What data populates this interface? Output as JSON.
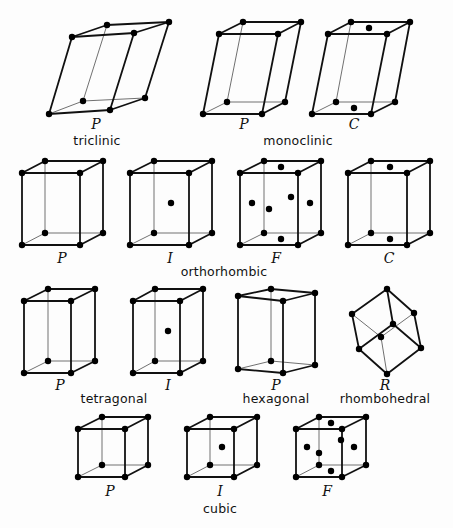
{
  "colors": {
    "line": "#111111",
    "node": "#000000",
    "background": "#fdfdfd"
  },
  "systems": [
    {
      "name": "triclinic",
      "label_pos": [
        97,
        145
      ]
    },
    {
      "name": "monoclinic",
      "label_pos": [
        298,
        145
      ]
    },
    {
      "name": "orthorhombic",
      "label_pos": [
        224,
        276
      ]
    },
    {
      "name": "tetragonal",
      "label_pos": [
        114,
        403
      ]
    },
    {
      "name": "hexagonal",
      "label_pos": [
        276,
        403
      ]
    },
    {
      "name": "rhombohedral",
      "label_pos": [
        385,
        403
      ]
    },
    {
      "name": "cubic",
      "label_pos": [
        220,
        513
      ]
    }
  ],
  "lattices": [
    {
      "id": "triclinic-P",
      "system": "triclinic",
      "centering": "P",
      "letter_pos": [
        96,
        129
      ],
      "vertices": {
        "tbl": [
          107,
          25
        ],
        "tbr": [
          169,
          22
        ],
        "tfl": [
          72,
          37
        ],
        "tfr": [
          134,
          33
        ],
        "bbl": [
          83,
          101
        ],
        "bbr": [
          145,
          98
        ],
        "bfl": [
          49,
          114
        ],
        "bfr": [
          110,
          110
        ]
      },
      "extra_points": []
    },
    {
      "id": "monoclinic-P",
      "system": "monoclinic",
      "centering": "P",
      "letter_pos": [
        244,
        129
      ],
      "vertices": {
        "tbl": [
          243,
          22
        ],
        "tbr": [
          301,
          22
        ],
        "tfl": [
          219,
          34
        ],
        "tfr": [
          278,
          34
        ],
        "bbl": [
          227,
          102
        ],
        "bbr": [
          285,
          102
        ],
        "bfl": [
          203,
          114
        ],
        "bfr": [
          262,
          114
        ]
      },
      "extra_points": []
    },
    {
      "id": "monoclinic-C",
      "system": "monoclinic",
      "centering": "C",
      "letter_pos": [
        354,
        129
      ],
      "vertices": {
        "tbl": [
          351,
          22
        ],
        "tbr": [
          410,
          22
        ],
        "tfl": [
          328,
          34
        ],
        "tfr": [
          387,
          34
        ],
        "bbl": [
          336,
          102
        ],
        "bbr": [
          395,
          102
        ],
        "bfl": [
          312,
          114
        ],
        "bfr": [
          371,
          114
        ]
      },
      "extra_points": [
        [
          369,
          28
        ],
        [
          354,
          108
        ]
      ]
    },
    {
      "id": "orthorhombic-P",
      "system": "orthorhombic",
      "centering": "P",
      "letter_pos": [
        62,
        263
      ],
      "vertices": {
        "tbl": [
          45,
          161
        ],
        "tbr": [
          103,
          161
        ],
        "tfl": [
          22,
          173
        ],
        "tfr": [
          80,
          173
        ],
        "bbl": [
          45,
          233
        ],
        "bbr": [
          103,
          233
        ],
        "bfl": [
          22,
          245
        ],
        "bfr": [
          80,
          245
        ]
      },
      "extra_points": []
    },
    {
      "id": "orthorhombic-I",
      "system": "orthorhombic",
      "centering": "I",
      "letter_pos": [
        170,
        263
      ],
      "vertices": {
        "tbl": [
          154,
          161
        ],
        "tbr": [
          212,
          161
        ],
        "tfl": [
          130,
          173
        ],
        "tfr": [
          189,
          173
        ],
        "bbl": [
          154,
          233
        ],
        "bbr": [
          212,
          233
        ],
        "bfl": [
          130,
          245
        ],
        "bfr": [
          189,
          245
        ]
      },
      "extra_points": [
        [
          171,
          203
        ]
      ]
    },
    {
      "id": "orthorhombic-F",
      "system": "orthorhombic",
      "centering": "F",
      "letter_pos": [
        276,
        263
      ],
      "vertices": {
        "tbl": [
          264,
          161
        ],
        "tbr": [
          321,
          161
        ],
        "tfl": [
          240,
          173
        ],
        "tfr": [
          298,
          173
        ],
        "bbl": [
          264,
          233
        ],
        "bbr": [
          321,
          233
        ],
        "bfl": [
          240,
          245
        ],
        "bfr": [
          298,
          245
        ]
      },
      "extra_points": [
        [
          281,
          167
        ],
        [
          281,
          239
        ],
        [
          252,
          203
        ],
        [
          310,
          203
        ],
        [
          291,
          197
        ],
        [
          269,
          209
        ]
      ]
    },
    {
      "id": "orthorhombic-C",
      "system": "orthorhombic",
      "centering": "C",
      "letter_pos": [
        389,
        263
      ],
      "vertices": {
        "tbl": [
          371,
          161
        ],
        "tbr": [
          430,
          161
        ],
        "tfl": [
          348,
          173
        ],
        "tfr": [
          407,
          173
        ],
        "bbl": [
          371,
          233
        ],
        "bbr": [
          430,
          233
        ],
        "bfl": [
          348,
          245
        ],
        "bfr": [
          407,
          245
        ]
      },
      "extra_points": [
        [
          390,
          167
        ],
        [
          390,
          239
        ]
      ]
    },
    {
      "id": "tetragonal-P",
      "system": "tetragonal",
      "centering": "P",
      "letter_pos": [
        60,
        390
      ],
      "vertices": {
        "tbl": [
          48,
          289
        ],
        "tbr": [
          95,
          289
        ],
        "tfl": [
          24,
          301
        ],
        "tfr": [
          71,
          301
        ],
        "bbl": [
          48,
          361
        ],
        "bbr": [
          95,
          361
        ],
        "bfl": [
          24,
          373
        ],
        "bfr": [
          71,
          373
        ]
      },
      "extra_points": []
    },
    {
      "id": "tetragonal-I",
      "system": "tetragonal",
      "centering": "I",
      "letter_pos": [
        168,
        390
      ],
      "vertices": {
        "tbl": [
          155,
          289
        ],
        "tbr": [
          203,
          289
        ],
        "tfl": [
          133,
          301
        ],
        "tfr": [
          180,
          301
        ],
        "bbl": [
          155,
          361
        ],
        "bbr": [
          203,
          361
        ],
        "bfl": [
          133,
          373
        ],
        "bfr": [
          180,
          373
        ]
      },
      "extra_points": [
        [
          168,
          331
        ]
      ]
    },
    {
      "id": "hexagonal-P",
      "system": "hexagonal",
      "centering": "P",
      "letter_pos": [
        276,
        390
      ],
      "vertices": {
        "tbl": [
          271,
          289
        ],
        "tbr": [
          315,
          293
        ],
        "tfl": [
          238,
          296
        ],
        "tfr": [
          283,
          301
        ],
        "bbl": [
          271,
          361
        ],
        "bbr": [
          315,
          365
        ],
        "bfl": [
          238,
          369
        ],
        "bfr": [
          283,
          373
        ]
      },
      "extra_points": []
    },
    {
      "id": "rhombohedral-R",
      "system": "rhombohedral",
      "centering": "R",
      "letter_pos": [
        385,
        390
      ],
      "vertices": {
        "T": [
          387,
          289
        ],
        "UL": [
          352,
          314
        ],
        "UR": [
          414,
          313
        ],
        "C1": [
          393,
          324
        ],
        "C2": [
          381,
          337
        ],
        "LL": [
          359,
          349
        ],
        "LR": [
          421,
          348
        ],
        "B": [
          387,
          374
        ]
      },
      "bold_edges": [
        [
          "T",
          "UL"
        ],
        [
          "T",
          "C1"
        ],
        [
          "T",
          "UR"
        ],
        [
          "UL",
          "LL"
        ],
        [
          "C1",
          "LL"
        ],
        [
          "C1",
          "LR"
        ],
        [
          "UR",
          "LR"
        ],
        [
          "LL",
          "B"
        ],
        [
          "LR",
          "B"
        ]
      ],
      "thin_edges": [
        [
          "UL",
          "C2"
        ],
        [
          "UR",
          "C2"
        ],
        [
          "C2",
          "B"
        ]
      ],
      "extra_points": []
    },
    {
      "id": "cubic-P",
      "system": "cubic",
      "centering": "P",
      "letter_pos": [
        110,
        496
      ],
      "vertices": {
        "tbl": [
          102,
          417
        ],
        "tbr": [
          148,
          417
        ],
        "tfl": [
          78,
          429
        ],
        "tfr": [
          125,
          429
        ],
        "bbl": [
          102,
          465
        ],
        "bbr": [
          148,
          465
        ],
        "bfl": [
          78,
          477
        ],
        "bfr": [
          125,
          477
        ]
      },
      "extra_points": []
    },
    {
      "id": "cubic-I",
      "system": "cubic",
      "centering": "I",
      "letter_pos": [
        220,
        496
      ],
      "vertices": {
        "tbl": [
          210,
          417
        ],
        "tbr": [
          257,
          417
        ],
        "tfl": [
          187,
          429
        ],
        "tfr": [
          234,
          429
        ],
        "bbl": [
          210,
          465
        ],
        "bbr": [
          257,
          465
        ],
        "bfl": [
          187,
          477
        ],
        "bfr": [
          234,
          477
        ]
      },
      "extra_points": [
        [
          222,
          447
        ]
      ]
    },
    {
      "id": "cubic-F",
      "system": "cubic",
      "centering": "F",
      "letter_pos": [
        327,
        496
      ],
      "vertices": {
        "tbl": [
          319,
          417
        ],
        "tbr": [
          366,
          417
        ],
        "tfl": [
          296,
          429
        ],
        "tfr": [
          342,
          429
        ],
        "bbl": [
          319,
          465
        ],
        "bbr": [
          366,
          465
        ],
        "bfl": [
          296,
          477
        ],
        "bfr": [
          342,
          477
        ]
      },
      "extra_points": [
        [
          331,
          423
        ],
        [
          331,
          471
        ],
        [
          307,
          447
        ],
        [
          354,
          447
        ],
        [
          319,
          453
        ],
        [
          341,
          440
        ]
      ]
    }
  ]
}
